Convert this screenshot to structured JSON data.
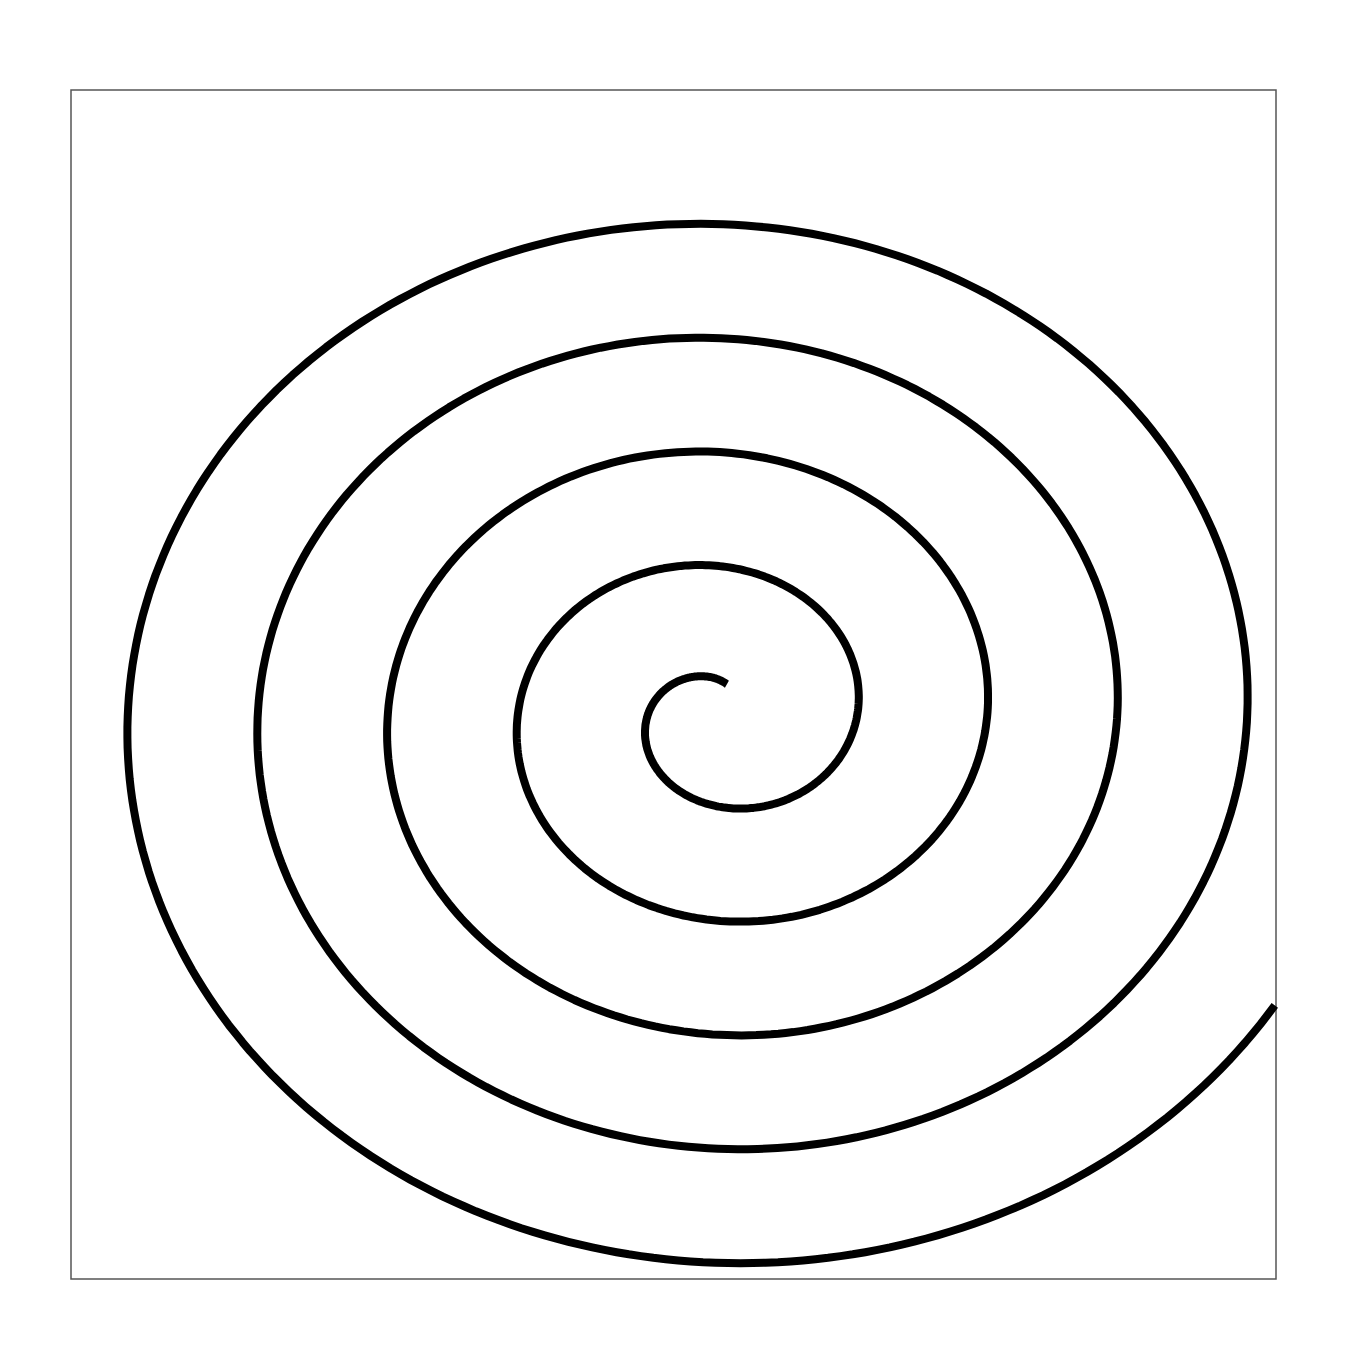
{
  "figure": {
    "frame": {
      "x": 71,
      "y": 90,
      "width": 1205,
      "height": 1189,
      "stroke": "#555555"
    },
    "spiral": {
      "type": "archimedean",
      "center": [
        737,
        688
      ],
      "turns": 5,
      "stroke": "#000000",
      "stroke_width": 8,
      "direction": "clockwise-outward"
    }
  }
}
